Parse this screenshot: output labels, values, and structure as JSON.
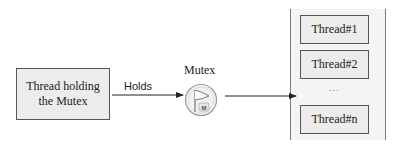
{
  "diagram": {
    "holder": {
      "line1": "Thread holding",
      "line2": "the Mutex"
    },
    "edge_holds": {
      "label": "Holds"
    },
    "mutex": {
      "label": "Mutex",
      "icon": "flag-icon",
      "badge": "M"
    },
    "queue": {
      "threads": [
        {
          "label": "Thread#1"
        },
        {
          "label": "Thread#2"
        },
        {
          "label": "Thread#n"
        }
      ],
      "ellipsis": "..."
    },
    "colors": {
      "box_fill": "#ececec",
      "box_border": "#555555",
      "queue_fill": "#f4f4f4",
      "arrow": "#222222"
    }
  }
}
